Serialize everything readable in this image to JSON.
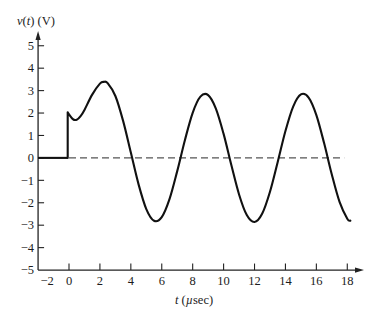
{
  "chart_data": {
    "type": "line",
    "title": "",
    "xlabel": "t (µsec)",
    "ylabel": "v(t) (V)",
    "xlabel_parts": [
      {
        "text": "t",
        "italic": true
      },
      {
        "text": " (",
        "italic": false
      },
      {
        "text": "µ",
        "italic": true
      },
      {
        "text": "sec)",
        "italic": false
      }
    ],
    "ylabel_parts": [
      {
        "text": "v",
        "italic": true
      },
      {
        "text": "(",
        "italic": false
      },
      {
        "text": "t",
        "italic": true
      },
      {
        "text": ") (V)",
        "italic": false
      }
    ],
    "xlim": [
      -2,
      19
    ],
    "ylim": [
      -5,
      5.5
    ],
    "xticks": [
      -2,
      0,
      2,
      4,
      6,
      8,
      10,
      12,
      14,
      16,
      18
    ],
    "xtick_labels": [
      "−2",
      "0",
      "2",
      "4",
      "6",
      "8",
      "10",
      "12",
      "14",
      "16",
      "18"
    ],
    "yticks": [
      5,
      4,
      3,
      2,
      1,
      0,
      -1,
      -2,
      -3,
      -4,
      -5
    ],
    "ytick_labels": [
      "5",
      "4",
      "3",
      "2",
      "1",
      "0",
      "−1",
      "−2",
      "−3",
      "−4",
      "−5"
    ],
    "grid": false,
    "legend": null,
    "reference_line": {
      "y": 0,
      "style": "dashed",
      "x_range": [
        0,
        17.8
      ]
    },
    "series": [
      {
        "name": "v(t)",
        "pre_step": {
          "x": [
            -2,
            0
          ],
          "y": [
            0,
            0
          ]
        },
        "step_at": 0,
        "x": [
          0,
          0.25,
          0.5,
          0.75,
          1.0,
          1.5,
          2.0,
          2.25,
          2.5,
          3.0,
          3.5,
          4.0,
          4.5,
          5.0,
          5.5,
          6.0,
          6.5,
          7.0,
          7.5,
          8.0,
          8.5,
          9.0,
          9.5,
          10.0,
          10.5,
          11.0,
          11.5,
          12.0,
          12.5,
          13.0,
          13.5,
          14.0,
          14.5,
          15.0,
          15.5,
          16.0,
          16.5,
          17.0,
          17.5,
          18.0,
          18.2
        ],
        "y": [
          2.03,
          1.73,
          1.7,
          1.86,
          2.14,
          2.82,
          3.31,
          3.39,
          3.33,
          2.76,
          1.65,
          0.24,
          -1.18,
          -2.28,
          -2.8,
          -2.64,
          -1.84,
          -0.59,
          0.8,
          2.01,
          2.73,
          2.8,
          2.2,
          1.07,
          -0.32,
          -1.63,
          -2.55,
          -2.86,
          -2.48,
          -1.51,
          -0.18,
          1.2,
          2.29,
          2.83,
          2.69,
          1.91,
          0.66,
          -0.74,
          -1.96,
          -2.71,
          -2.8
        ]
      }
    ],
    "key_points": {
      "step_jump": {
        "t": 0,
        "v_before": 0,
        "v_after": 2.0
      },
      "initial_dip": {
        "t": 0.3,
        "v": 1.66
      },
      "peaks": [
        {
          "t": 2.1,
          "v": 3.42
        },
        {
          "t": 8.7,
          "v": 2.86
        },
        {
          "t": 15.1,
          "v": 2.87
        }
      ],
      "troughs": [
        {
          "t": 5.7,
          "v": -2.82
        },
        {
          "t": 12.0,
          "v": -2.86
        }
      ],
      "zero_crossings": [
        4.1,
        7.1,
        10.5,
        13.5,
        16.8
      ]
    }
  }
}
